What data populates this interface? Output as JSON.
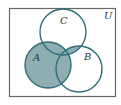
{
  "diagram": {
    "type": "venn",
    "universe_label": "U",
    "sets": [
      {
        "label": "A",
        "cx": 48,
        "cy": 65,
        "r": 23
      },
      {
        "label": "B",
        "cx": 79,
        "cy": 69,
        "r": 23
      },
      {
        "label": "C",
        "cx": 63,
        "cy": 32,
        "r": 23
      }
    ],
    "shaded_region": "A ∪ (B ∩ C)",
    "colors": {
      "stroke": "#2e6f78",
      "fill": "#8eaeb2",
      "border": "#555555",
      "background": "#ffffff"
    }
  }
}
